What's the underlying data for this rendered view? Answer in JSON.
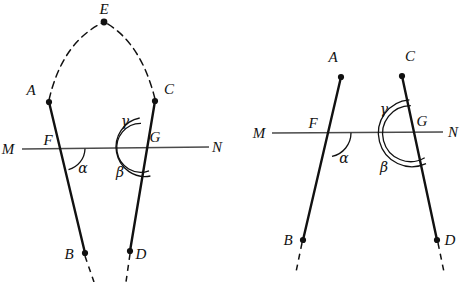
{
  "figure": {
    "background_color": "#ffffff",
    "stroke_color": "#111111",
    "thin_stroke_color": "#4a4a4a",
    "figures": [
      {
        "id": "left-figure",
        "name": "left-diagram-with-apex-E",
        "transversal": {
          "name": "line-MN",
          "left_label": "M",
          "right_label": "N",
          "left_label_pos": [
            8,
            150
          ],
          "right_label_pos": [
            214,
            148
          ],
          "x1": 22,
          "y1": 149,
          "x2": 209,
          "y2": 147
        },
        "points": [
          {
            "label": "A",
            "x": 49,
            "y": 102,
            "label_x": 31,
            "label_y": 95,
            "dot": true
          },
          {
            "label": "B",
            "x": 85,
            "y": 253,
            "label_x": 69,
            "label_y": 258,
            "dot": true
          },
          {
            "label": "C",
            "x": 155,
            "y": 101,
            "label_x": 166,
            "label_y": 94,
            "dot": true
          },
          {
            "label": "D",
            "x": 130,
            "y": 251,
            "label_x": 139,
            "label_y": 258,
            "dot": true
          },
          {
            "label": "E",
            "x": 104,
            "y": 22,
            "label_x": 98,
            "label_y": 14,
            "dot": true
          },
          {
            "label": "F",
            "x": 63,
            "y": 149,
            "label_x": 46,
            "label_y": 145,
            "dot": false
          },
          {
            "label": "G",
            "x": 145,
            "y": 147,
            "label_x": 152,
            "label_y": 142,
            "dot": false
          }
        ],
        "segments": [
          {
            "name": "segment-AB",
            "x1": 49,
            "y1": 102,
            "x2": 85,
            "y2": 253,
            "style": "solid",
            "width": 2.4
          },
          {
            "name": "segment-CD",
            "x1": 155,
            "y1": 101,
            "x2": 130,
            "y2": 251,
            "style": "solid",
            "width": 2.4
          }
        ],
        "dashed_extensions": [
          {
            "name": "dashed-below-B",
            "x1": 85,
            "y1": 255,
            "x2": 94,
            "y2": 282
          },
          {
            "name": "dashed-below-D",
            "x1": 130,
            "y1": 253,
            "x2": 126,
            "y2": 282
          }
        ],
        "dashed_arcs": [
          {
            "name": "dashed-arc-A-to-E",
            "d": "M 49 100 Q 62 43 102 23"
          },
          {
            "name": "dashed-arc-C-to-E",
            "d": "M 155 99 Q 141 43 106 23"
          }
        ],
        "angles": [
          {
            "label": "α",
            "name": "angle-alpha-at-F",
            "label_x": 79,
            "label_y": 170
          },
          {
            "label": "β",
            "name": "angle-beta-at-G",
            "label_x": 120,
            "label_y": 175
          },
          {
            "label": "γ",
            "name": "angle-gamma-at-G",
            "label_x": 122,
            "label_y": 125
          }
        ]
      },
      {
        "id": "right-figure",
        "name": "right-diagram-plain",
        "transversal": {
          "name": "line-MN",
          "left_label": "M",
          "right_label": "N",
          "left_label_pos": [
            255,
            135
          ],
          "right_label_pos": [
            449,
            134
          ],
          "x1": 272,
          "y1": 133,
          "x2": 443,
          "y2": 132
        },
        "points": [
          {
            "label": "A",
            "x": 341,
            "y": 77,
            "label_x": 328,
            "label_y": 63,
            "dot": true
          },
          {
            "label": "B",
            "x": 303,
            "y": 240,
            "label_x": 287,
            "label_y": 243,
            "dot": true
          },
          {
            "label": "C",
            "x": 402,
            "y": 76,
            "label_x": 405,
            "label_y": 62,
            "dot": true
          },
          {
            "label": "D",
            "x": 437,
            "y": 240,
            "label_x": 445,
            "label_y": 243,
            "dot": true
          },
          {
            "label": "F",
            "x": 327,
            "y": 133,
            "label_x": 311,
            "label_y": 128,
            "dot": false
          },
          {
            "label": "G",
            "x": 416,
            "y": 132,
            "label_x": 418,
            "label_y": 126,
            "dot": false
          }
        ],
        "segments": [
          {
            "name": "segment-AB",
            "x1": 341,
            "y1": 77,
            "x2": 303,
            "y2": 240,
            "style": "solid",
            "width": 2.4
          },
          {
            "name": "segment-CD",
            "x1": 402,
            "y1": 76,
            "x2": 437,
            "y2": 240,
            "style": "solid",
            "width": 2.4
          }
        ],
        "dashed_extensions": [
          {
            "name": "dashed-below-B",
            "x1": 302,
            "y1": 243,
            "x2": 296,
            "y2": 272
          },
          {
            "name": "dashed-below-D",
            "x1": 438,
            "y1": 243,
            "x2": 444,
            "y2": 272
          }
        ],
        "dashed_arcs": [],
        "angles": [
          {
            "label": "α",
            "name": "angle-alpha-at-F",
            "label_x": 340,
            "label_y": 160
          },
          {
            "label": "β",
            "name": "angle-beta-at-G",
            "label_x": 381,
            "label_y": 170
          },
          {
            "label": "γ",
            "name": "angle-gamma-at-G",
            "label_x": 382,
            "label_y": 112
          }
        ]
      }
    ]
  }
}
